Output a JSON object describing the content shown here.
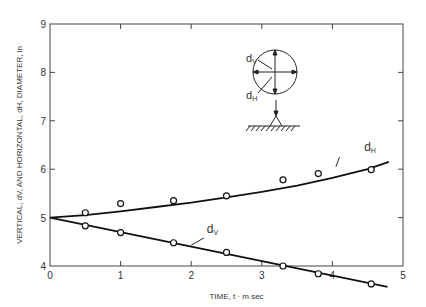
{
  "chart_data": {
    "type": "line",
    "title": "",
    "xlabel": "TIME, t · m sec",
    "ylabel": "VERTICAL, dV, AND HORIZONTAL, dH, DIAMETER, in",
    "xlim": [
      0,
      5
    ],
    "ylim": [
      4,
      9
    ],
    "xticks": [
      "0",
      "1",
      "2",
      "3",
      "4",
      "5"
    ],
    "yticks": [
      "4",
      "5",
      "6",
      "7",
      "8",
      "9"
    ],
    "grid": false,
    "series": [
      {
        "name": "dH",
        "label": "dH",
        "marker": "open-circle",
        "points": [
          [
            0.5,
            5.1
          ],
          [
            1.0,
            5.29
          ],
          [
            1.75,
            5.35
          ],
          [
            2.5,
            5.45
          ],
          [
            3.3,
            5.78
          ],
          [
            3.8,
            5.91
          ],
          [
            4.55,
            5.99
          ]
        ],
        "curve": [
          [
            0,
            5.0
          ],
          [
            0.5,
            5.05
          ],
          [
            1.0,
            5.13
          ],
          [
            1.5,
            5.22
          ],
          [
            2.0,
            5.31
          ],
          [
            2.5,
            5.42
          ],
          [
            3.0,
            5.53
          ],
          [
            3.5,
            5.66
          ],
          [
            4.0,
            5.82
          ],
          [
            4.5,
            6.0
          ],
          [
            4.8,
            6.15
          ]
        ]
      },
      {
        "name": "dV",
        "label": "dV",
        "marker": "open-circle",
        "points": [
          [
            0.5,
            4.83
          ],
          [
            1.0,
            4.69
          ],
          [
            1.75,
            4.48
          ],
          [
            2.5,
            4.28
          ],
          [
            3.3,
            4.0
          ],
          [
            3.8,
            3.84
          ],
          [
            4.55,
            3.63
          ]
        ],
        "curve": [
          [
            0,
            5.0
          ],
          [
            4.78,
            3.57
          ]
        ]
      }
    ],
    "annotations": {
      "inset": {
        "labels": [
          "dV",
          "dH"
        ],
        "description": "circle with vertical and horizontal diameter arrows, resting on ground support"
      }
    }
  }
}
